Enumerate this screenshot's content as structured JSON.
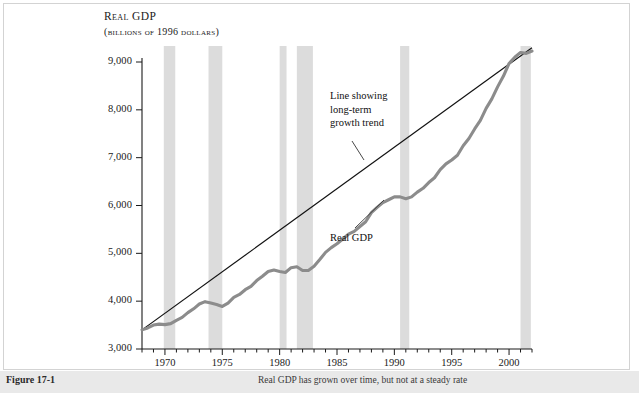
{
  "figure": {
    "title_line1": "Real GDP",
    "title_line2": "(billions of 1996 dollars)",
    "caption_label": "Figure 17-1",
    "caption_text": "Real GDP has grown over time, but not at a steady rate"
  },
  "annotations": {
    "trend": "Line showing\nlong-term\ngrowth trend",
    "trend_l1": "Line showing",
    "trend_l2": "long-term",
    "trend_l3": "growth trend",
    "gdp": "Real GDP"
  },
  "colors": {
    "gdp_line": "#8c8c8c",
    "trend_line": "#111111",
    "recession_band": "#dcdcdc",
    "frame_border": "#d3d3d3",
    "caption_bg": "#e9e9e9",
    "background": "#ffffff"
  },
  "chart_data": {
    "type": "line",
    "title": "Real GDP",
    "subtitle": "(billions of 1996 dollars)",
    "xlabel": "",
    "ylabel": "Real GDP (billions of 1996 dollars)",
    "xlim": [
      1968,
      2002
    ],
    "ylim": [
      3000,
      9500
    ],
    "yticks": [
      3000,
      4000,
      5000,
      6000,
      7000,
      8000,
      9000
    ],
    "ytick_labels": [
      "3,000",
      "4,000",
      "5,000",
      "6,000",
      "7,000",
      "8,000",
      "9,000"
    ],
    "xticks": [
      1970,
      1975,
      1980,
      1985,
      1990,
      1995,
      2000
    ],
    "xtick_labels": [
      "1970",
      "1975",
      "1980",
      "1985",
      "1990",
      "1995",
      "2000"
    ],
    "xminor_tick_interval": 1,
    "grid": false,
    "legend": "none",
    "series": [
      {
        "name": "Real GDP",
        "style": "thick-gray-wavy",
        "x": [
          1968,
          1968.5,
          1969,
          1969.5,
          1970,
          1970.5,
          1971,
          1971.5,
          1972,
          1972.5,
          1973,
          1973.5,
          1974,
          1974.5,
          1975,
          1975.5,
          1976,
          1976.5,
          1977,
          1977.5,
          1978,
          1978.5,
          1979,
          1979.5,
          1980,
          1980.5,
          1981,
          1981.5,
          1982,
          1982.5,
          1983,
          1983.5,
          1984,
          1984.5,
          1985,
          1985.5,
          1986,
          1986.5,
          1987,
          1987.5,
          1988,
          1988.5,
          1989,
          1989.5,
          1990,
          1990.5,
          1991,
          1991.5,
          1992,
          1992.5,
          1993,
          1993.5,
          1994,
          1994.5,
          1995,
          1995.5,
          1996,
          1996.5,
          1997,
          1997.5,
          1998,
          1998.5,
          1999,
          1999.5,
          2000,
          2000.5,
          2001,
          2001.5,
          2002
        ],
        "values": [
          3400,
          3440,
          3500,
          3520,
          3510,
          3530,
          3600,
          3660,
          3760,
          3840,
          3940,
          3990,
          3960,
          3930,
          3890,
          3960,
          4080,
          4140,
          4240,
          4310,
          4430,
          4520,
          4620,
          4650,
          4620,
          4600,
          4700,
          4720,
          4640,
          4640,
          4730,
          4870,
          5020,
          5120,
          5200,
          5300,
          5400,
          5460,
          5560,
          5660,
          5850,
          5960,
          6060,
          6120,
          6180,
          6180,
          6140,
          6180,
          6280,
          6360,
          6480,
          6580,
          6750,
          6870,
          6950,
          7050,
          7250,
          7400,
          7600,
          7780,
          8030,
          8230,
          8480,
          8700,
          8970,
          9100,
          9200,
          9180,
          9230
        ]
      },
      {
        "name": "Long-term growth trend",
        "style": "thin-black-straight",
        "x": [
          1968,
          2002
        ],
        "values": [
          3400,
          9300
        ]
      }
    ],
    "shaded_regions": {
      "label": "recession bands",
      "color": "#dcdcdc",
      "spans": [
        [
          1969.9,
          1970.9
        ],
        [
          1973.8,
          1975.0
        ],
        [
          1980.0,
          1980.6
        ],
        [
          1981.5,
          1982.9
        ],
        [
          1990.5,
          1991.3
        ],
        [
          2001.0,
          2001.9
        ]
      ]
    },
    "annotations": [
      {
        "text": "Line showing long-term growth trend",
        "x": 1985,
        "y": 7600
      },
      {
        "text": "Real GDP",
        "x": 1985,
        "y": 4500
      }
    ]
  }
}
